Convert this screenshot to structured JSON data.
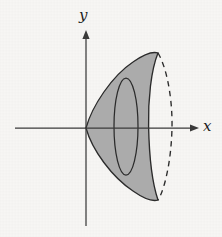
{
  "figure": {
    "kind": "math-diagram",
    "background_color": "#f7f6f4",
    "ink_color": "#262626",
    "fill_color": "#a8a8a8",
    "axes": {
      "x_label": "x",
      "y_label": "y",
      "x_axis": {
        "x_start": 15,
        "x_end": 200,
        "y": 128,
        "arrow": "right"
      },
      "y_axis": {
        "y_start": 30,
        "y_end": 226,
        "x": 86,
        "arrow": "up"
      },
      "origin": {
        "x": 86,
        "y": 128
      }
    },
    "solid": {
      "vertex": {
        "x": 86,
        "y": 128
      },
      "top_rim": {
        "x": 158,
        "y": 53
      },
      "bottom_rim": {
        "x": 158,
        "y": 200
      },
      "end_ellipse": {
        "center_x": 164.5,
        "center_y": 126.5,
        "radius_x": 7.5,
        "radius_y": 73.5,
        "front_half": "solid",
        "back_half": "dashed"
      },
      "cross_section_disk": {
        "center_x": 126,
        "center_y": 126.5,
        "radius_x": 12,
        "radius_y": 48.5,
        "stroke": "solid"
      }
    }
  }
}
